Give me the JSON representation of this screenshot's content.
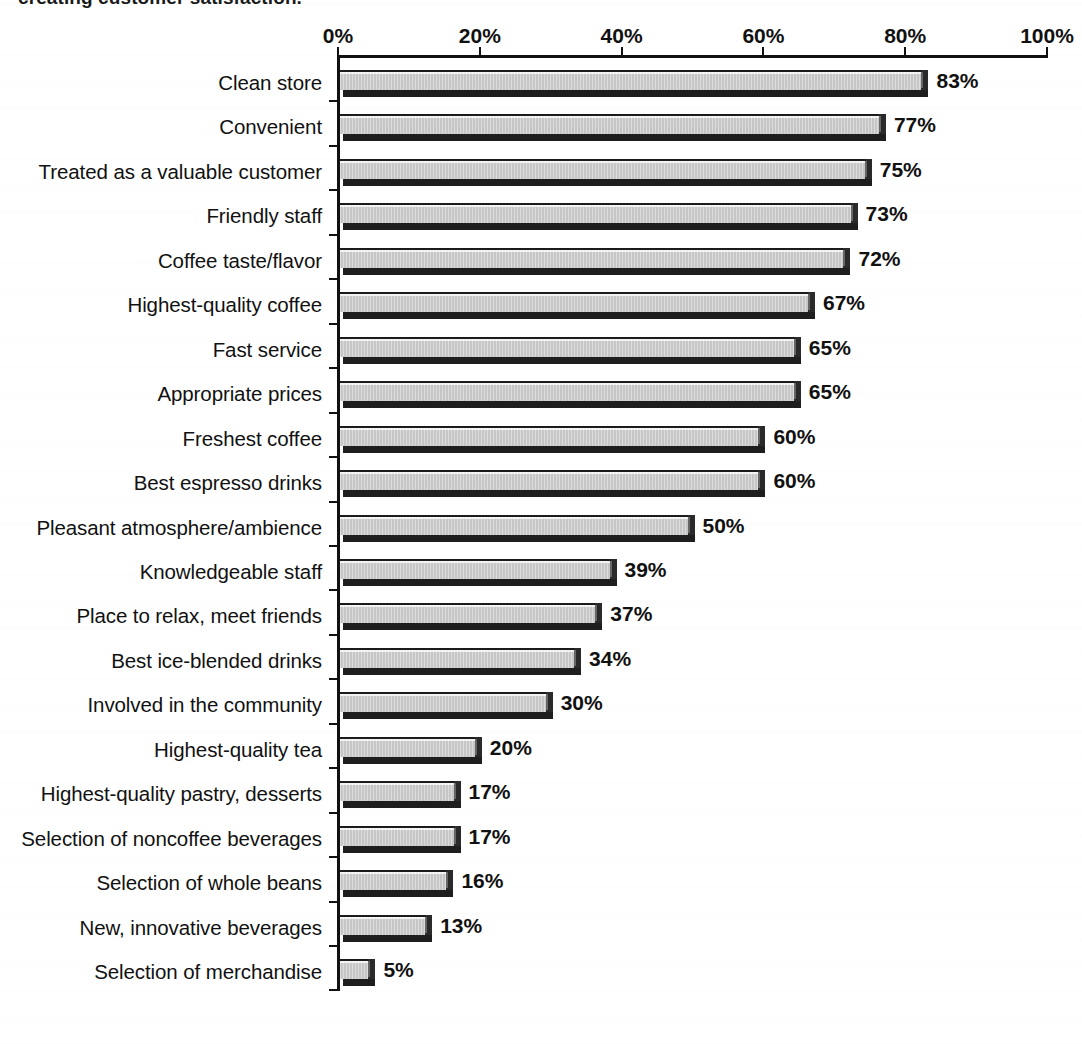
{
  "caption": {
    "text": "creating customer satisfaction."
  },
  "chart_data": {
    "type": "bar",
    "orientation": "horizontal",
    "title": "",
    "subtitle": "",
    "xlabel": "",
    "ylabel": "",
    "xlim": [
      0,
      100
    ],
    "grid": false,
    "legend": null,
    "xtick_labels": [
      "0%",
      "20%",
      "40%",
      "60%",
      "80%",
      "100%"
    ],
    "xticks": [
      0,
      20,
      40,
      60,
      80,
      100
    ],
    "value_label_suffix": "%",
    "categories": [
      "Clean store",
      "Convenient",
      "Treated as a valuable customer",
      "Friendly staff",
      "Coffee taste/flavor",
      "Highest-quality coffee",
      "Fast service",
      "Appropriate prices",
      "Freshest coffee",
      "Best espresso drinks",
      "Pleasant atmosphere/ambience",
      "Knowledgeable staff",
      "Place to relax, meet friends",
      "Best ice-blended drinks",
      "Involved in the community",
      "Highest-quality tea",
      "Highest-quality pastry, desserts",
      "Selection of noncoffee beverages",
      "Selection of whole beans",
      "New, innovative beverages",
      "Selection of merchandise"
    ],
    "values": [
      83,
      77,
      75,
      73,
      72,
      67,
      65,
      65,
      60,
      60,
      50,
      39,
      37,
      34,
      30,
      20,
      17,
      17,
      16,
      13,
      5
    ],
    "value_labels": [
      "83%",
      "77%",
      "75%",
      "73%",
      "72%",
      "67%",
      "65%",
      "65%",
      "60%",
      "60%",
      "50%",
      "39%",
      "37%",
      "34%",
      "30%",
      "20%",
      "17%",
      "17%",
      "16%",
      "13%",
      "5%"
    ]
  },
  "colors": {
    "bar_fill": "#c6c6c6",
    "bar_shadow": "#1e1e1e",
    "axis": "#111111",
    "text": "#111111",
    "background": "#ffffff"
  }
}
